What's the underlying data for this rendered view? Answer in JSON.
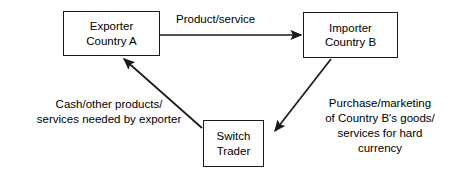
{
  "diagram": {
    "background_color": "#ffffff",
    "line_color": "#1a1a1a",
    "text_color": "#000000"
  },
  "nodes": {
    "exporter": {
      "name": "exporter-country-a",
      "line1": "Exporter",
      "line2": "Country A"
    },
    "importer": {
      "name": "importer-country-b",
      "line1": "Importer",
      "line2": "Country B"
    },
    "switch_trader": {
      "name": "switch-trader",
      "line1": "Switch",
      "line2": "Trader"
    }
  },
  "edges": {
    "exporter_to_importer": {
      "label": "Product/service",
      "from": "exporter",
      "to": "importer"
    },
    "importer_to_switch": {
      "label_line1": "Purchase/marketing",
      "label_line2": "of Country B's goods/",
      "label_line3": "services for hard",
      "label_line4": "currency",
      "from": "importer",
      "to": "switch_trader"
    },
    "switch_to_exporter": {
      "label_line1": "Cash/other products/",
      "label_line2": "services needed by exporter",
      "from": "switch_trader",
      "to": "exporter"
    }
  }
}
